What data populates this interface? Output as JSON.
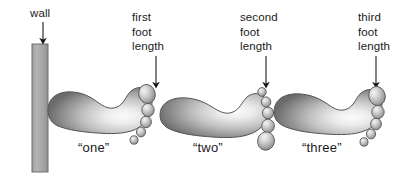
{
  "figure": {
    "type": "diagram",
    "background_color": "#ffffff",
    "text_color": "#1a1a1a",
    "wall": {
      "label": "wall",
      "fill_color": "#a8a8a8",
      "stroke_color": "#6e6e6e",
      "x": 32,
      "y": 44,
      "width": 16,
      "height": 128
    },
    "callouts": [
      {
        "id": "first",
        "lines": [
          "first",
          "foot",
          "length"
        ],
        "text_x": 132,
        "text_y": 10,
        "arrow_x": 156,
        "arrow_top": 56,
        "arrow_bottom": 88
      },
      {
        "id": "second",
        "lines": [
          "second",
          "foot",
          "length"
        ],
        "text_x": 240,
        "text_y": 10,
        "arrow_x": 266,
        "arrow_top": 56,
        "arrow_bottom": 88
      },
      {
        "id": "third",
        "lines": [
          "third",
          "foot",
          "length"
        ],
        "text_x": 358,
        "text_y": 10,
        "arrow_x": 376,
        "arrow_top": 56,
        "arrow_bottom": 88
      }
    ],
    "footprints": [
      {
        "id": "one",
        "caption": "“one”",
        "caption_x": 78,
        "caption_y": 140,
        "orientation": "toes-up-right",
        "sole_fill_light": "#f2f2f2",
        "sole_fill_dark": "#6f6f6f",
        "outline_color": "#555555",
        "toe_count": 5
      },
      {
        "id": "two",
        "caption": "“two”",
        "caption_x": 193,
        "caption_y": 140,
        "orientation": "toes-down-right",
        "sole_fill_light": "#f2f2f2",
        "sole_fill_dark": "#6f6f6f",
        "outline_color": "#555555",
        "toe_count": 5
      },
      {
        "id": "three",
        "caption": "“three”",
        "caption_x": 302,
        "caption_y": 140,
        "orientation": "toes-up-right",
        "sole_fill_light": "#f2f2f2",
        "sole_fill_dark": "#6f6f6f",
        "outline_color": "#555555",
        "toe_count": 5
      }
    ]
  }
}
